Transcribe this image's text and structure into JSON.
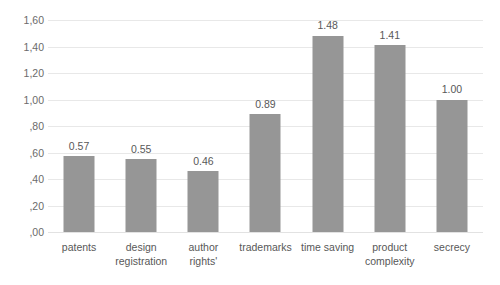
{
  "chart_data": {
    "type": "bar",
    "title": "",
    "subtitle": "",
    "xlabel": "",
    "ylabel": "",
    "categories": [
      "patents",
      "design registration",
      "author rights'",
      "trademarks",
      "time saving",
      "product complexity",
      "secrecy"
    ],
    "values": [
      0.57,
      0.55,
      0.46,
      0.89,
      1.48,
      1.41,
      1.0
    ],
    "value_labels": [
      "0.57",
      "0.55",
      "0.46",
      "0.89",
      "1.48",
      "1.41",
      "1.00"
    ],
    "ylim": [
      0.0,
      1.6
    ],
    "ytick_values": [
      0.0,
      0.2,
      0.4,
      0.6,
      0.8,
      1.0,
      1.2,
      1.4,
      1.6
    ],
    "ytick_labels": [
      ",00",
      ",20",
      ",40",
      ",60",
      ",80",
      "1,00",
      "1,20",
      "1,40",
      "1,60"
    ],
    "grid": true,
    "grid_axis": "y",
    "legend": false,
    "legend_position": "none",
    "bar_color": "#969696",
    "gridline_color": "#e8e8e8",
    "background_color": "#ffffff",
    "label_color": "#585858",
    "tick_color": "#6b6b6b"
  }
}
